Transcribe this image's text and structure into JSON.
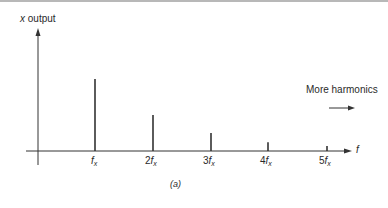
{
  "chart_data": {
    "type": "bar",
    "title": "",
    "caption": "(a)",
    "ylabel": "x output",
    "xlabel": "f",
    "categories": [
      "f_x",
      "2f_x",
      "3f_x",
      "4f_x",
      "5f_x"
    ],
    "values": [
      1.0,
      0.5,
      0.25,
      0.12,
      0.07
    ],
    "annotation": "More harmonics",
    "annotation_arrow": "right",
    "grid": false,
    "legend": null
  },
  "labels": {
    "y_axis_var": "x",
    "y_axis_word": "output",
    "x_axis": "f",
    "annotation": "More harmonics",
    "caption": "(a)",
    "ticks": [
      {
        "coef": "",
        "base": "f",
        "sub": "x"
      },
      {
        "coef": "2",
        "base": "f",
        "sub": "x"
      },
      {
        "coef": "3",
        "base": "f",
        "sub": "x"
      },
      {
        "coef": "4",
        "base": "f",
        "sub": "x"
      },
      {
        "coef": "5",
        "base": "f",
        "sub": "x"
      }
    ]
  }
}
